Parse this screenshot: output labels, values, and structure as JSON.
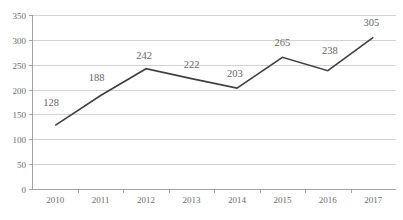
{
  "chart_data": {
    "type": "line",
    "title": "",
    "xlabel": "",
    "ylabel": "",
    "categories": [
      "2010",
      "2011",
      "2012",
      "2013",
      "2014",
      "2015",
      "2016",
      "2017"
    ],
    "values": [
      128,
      188,
      242,
      222,
      203,
      265,
      238,
      305
    ],
    "data_labels": [
      "128",
      "188",
      "242",
      "222",
      "203",
      "265",
      "238",
      "305"
    ],
    "ylim": [
      0,
      350
    ],
    "ytick_values": [
      0,
      50,
      100,
      150,
      200,
      250,
      300,
      350
    ],
    "ytick_labels": [
      "0",
      "50",
      "100",
      "150",
      "200",
      "250",
      "300",
      "350"
    ],
    "grid": true,
    "grid_axis": "y",
    "legend": false,
    "legend_position": "none",
    "series_color": "#404040",
    "grid_color": "#bfbfbf",
    "axis_color": "#9a9a9a",
    "label_color": "#666666",
    "tick_color": "#6b6b6b",
    "background": "#ffffff"
  }
}
